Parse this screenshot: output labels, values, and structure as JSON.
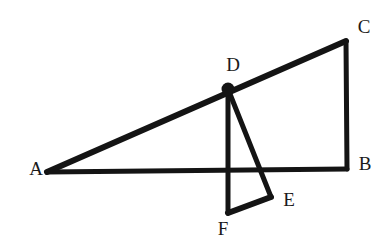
{
  "figure": {
    "type": "geometry-diagram",
    "canvas": {
      "width": 387,
      "height": 249
    },
    "background_color": "#ffffff",
    "stroke_color": "#141414"
  },
  "points": {
    "A": {
      "label": "A",
      "x": 47,
      "y": 172,
      "label_x": 36,
      "label_y": 168,
      "marked": false
    },
    "B": {
      "label": "B",
      "x": 347,
      "y": 169,
      "label_x": 365,
      "label_y": 163,
      "marked": false
    },
    "C": {
      "label": "C",
      "x": 346,
      "y": 41,
      "label_x": 364,
      "label_y": 26,
      "marked": false
    },
    "D": {
      "label": "D",
      "x": 228,
      "y": 89,
      "label_x": 233,
      "label_y": 64,
      "marked": true,
      "dot_radius": 6.5
    },
    "E": {
      "label": "E",
      "x": 271,
      "y": 197,
      "label_x": 289,
      "label_y": 199,
      "marked": false
    },
    "F": {
      "label": "F",
      "x": 228,
      "y": 213,
      "label_x": 223,
      "label_y": 228,
      "marked": false
    }
  },
  "segments": [
    {
      "name": "segment-AC",
      "from": "A",
      "to": "C",
      "width": 6
    },
    {
      "name": "segment-AB",
      "from": "A",
      "to": "B",
      "width": 5
    },
    {
      "name": "segment-CB",
      "from": "C",
      "to": "B",
      "width": 5
    },
    {
      "name": "segment-DF",
      "from": "D",
      "to": "F",
      "width": 5
    },
    {
      "name": "segment-DE",
      "from": "D",
      "to": "E",
      "width": 5
    },
    {
      "name": "segment-FE",
      "from": "F",
      "to": "E",
      "width": 6
    }
  ],
  "labels_order": [
    "C",
    "D",
    "A",
    "B",
    "E",
    "F"
  ]
}
